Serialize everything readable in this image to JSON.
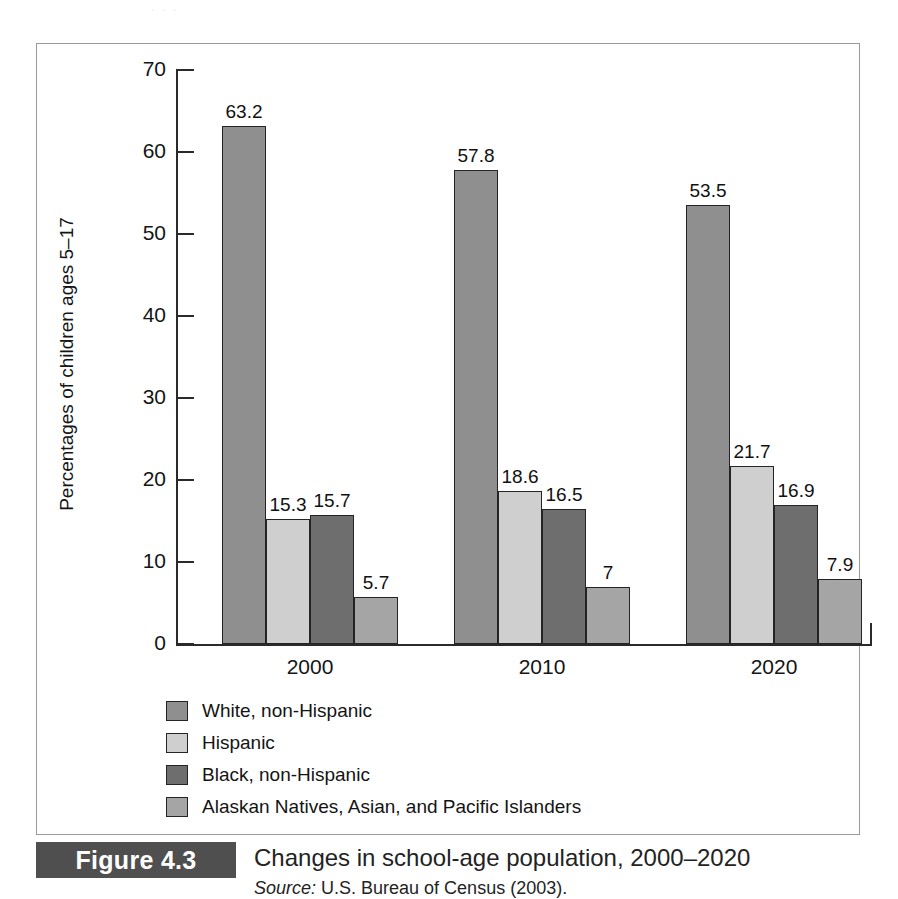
{
  "figure": {
    "tag": "Figure 4.3",
    "title": "Changes in school-age population, 2000–2020",
    "source_prefix": "Source:",
    "source_text": " U.S. Bureau of Census (2003).",
    "top_bleed_text": "·  ·  ·"
  },
  "colors": {
    "series_white_non_hispanic": "#8f8f8f",
    "series_hispanic": "#cfcfcf",
    "series_black_non_hispanic": "#6e6e6e",
    "series_alaskan_asian_pacific": "#a5a5a5",
    "axis": "#2a2a2a",
    "frame": "#9a9a9a",
    "tag_background": "#4f4f4f",
    "tag_text": "#ffffff"
  },
  "chart_data": {
    "type": "bar",
    "title": "Changes in school-age population, 2000–2020",
    "xlabel": "",
    "ylabel": "Percentages of children ages 5–17",
    "ylim": [
      0,
      70
    ],
    "yticks": [
      0,
      10,
      20,
      30,
      40,
      50,
      60,
      70
    ],
    "ytick_labels": [
      "0",
      "10",
      "20",
      "30",
      "40",
      "50",
      "60",
      "70"
    ],
    "grid": false,
    "legend_position": "below-axes-left",
    "categories": [
      "2000",
      "2010",
      "2020"
    ],
    "series": [
      {
        "name": "White, non-Hispanic",
        "color": "#8f8f8f",
        "values": [
          63.2,
          57.8,
          53.5
        ],
        "labels": [
          "63.2",
          "57.8",
          "53.5"
        ]
      },
      {
        "name": "Hispanic",
        "color": "#cfcfcf",
        "values": [
          15.3,
          18.6,
          21.7
        ],
        "labels": [
          "15.3",
          "18.6",
          "21.7"
        ]
      },
      {
        "name": "Black, non-Hispanic",
        "color": "#6e6e6e",
        "values": [
          15.7,
          16.5,
          16.9
        ],
        "labels": [
          "15.7",
          "16.5",
          "16.9"
        ]
      },
      {
        "name": "Alaskan Natives, Asian, and Pacific Islanders",
        "color": "#a5a5a5",
        "values": [
          5.7,
          7.0,
          7.9
        ],
        "labels": [
          "5.7",
          "7",
          "7.9"
        ]
      }
    ]
  },
  "legend": {
    "items": [
      {
        "label": "White, non-Hispanic",
        "color": "#8f8f8f"
      },
      {
        "label": "Hispanic",
        "color": "#cfcfcf"
      },
      {
        "label": "Black, non-Hispanic",
        "color": "#6e6e6e"
      },
      {
        "label": "Alaskan Natives, Asian, and Pacific Islanders",
        "color": "#a5a5a5"
      }
    ]
  }
}
